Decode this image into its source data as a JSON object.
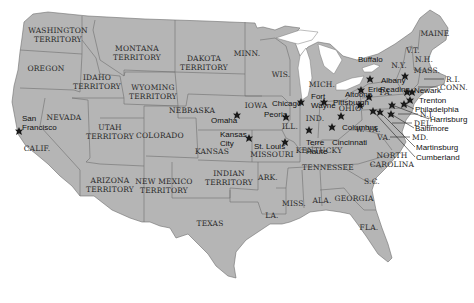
{
  "map": {
    "colors": {
      "land": "#b5b5b5",
      "border": "#6e6e6e",
      "water": "#ffffff",
      "marker": "#1a1a1a",
      "text": "#2a2a2a"
    },
    "regions": [
      {
        "id": "washington",
        "lines": [
          "WASHINGTON",
          "TERRITORY"
        ],
        "x": 58,
        "y": 33
      },
      {
        "id": "oregon",
        "lines": [
          "OREGON"
        ],
        "x": 46,
        "y": 71
      },
      {
        "id": "idaho",
        "lines": [
          "IDAHO",
          "TERRITORY"
        ],
        "x": 97,
        "y": 80
      },
      {
        "id": "montana",
        "lines": [
          "MONTANA",
          "TERRITORY"
        ],
        "x": 137,
        "y": 51
      },
      {
        "id": "wyoming",
        "lines": [
          "WYOMING",
          "TERRITORY"
        ],
        "x": 153,
        "y": 90
      },
      {
        "id": "dakota",
        "lines": [
          "DAKOTA",
          "TERRITORY"
        ],
        "x": 204,
        "y": 61
      },
      {
        "id": "minn",
        "lines": [
          "MINN."
        ],
        "x": 247,
        "y": 56
      },
      {
        "id": "wis",
        "lines": [
          "WIS."
        ],
        "x": 281,
        "y": 77
      },
      {
        "id": "mich",
        "lines": [
          "MICH."
        ],
        "x": 322,
        "y": 87
      },
      {
        "id": "nevada",
        "lines": [
          "NEVADA"
        ],
        "x": 64,
        "y": 120
      },
      {
        "id": "california",
        "lines": [
          "CALIF."
        ],
        "x": 37,
        "y": 151
      },
      {
        "id": "utah",
        "lines": [
          "UTAH",
          "TERRITORY"
        ],
        "x": 110,
        "y": 130
      },
      {
        "id": "colorado",
        "lines": [
          "COLORADO"
        ],
        "x": 160,
        "y": 138
      },
      {
        "id": "nebraska",
        "lines": [
          "NEBRASKA"
        ],
        "x": 192,
        "y": 113
      },
      {
        "id": "iowa",
        "lines": [
          "IOWA"
        ],
        "x": 256,
        "y": 108
      },
      {
        "id": "kansas",
        "lines": [
          "KANSAS"
        ],
        "x": 212,
        "y": 154
      },
      {
        "id": "missouri",
        "lines": [
          "MISSOURI"
        ],
        "x": 272,
        "y": 157
      },
      {
        "id": "ill",
        "lines": [
          "ILL."
        ],
        "x": 290,
        "y": 129
      },
      {
        "id": "ind",
        "lines": [
          "IND."
        ],
        "x": 315,
        "y": 121
      },
      {
        "id": "ohio",
        "lines": [
          "OHIO"
        ],
        "x": 350,
        "y": 111
      },
      {
        "id": "kentucky",
        "lines": [
          "KENTUCKY"
        ],
        "x": 319,
        "y": 153
      },
      {
        "id": "wva",
        "lines": [
          "W. VA."
        ],
        "x": 368,
        "y": 132
      },
      {
        "id": "va",
        "lines": [
          "VA."
        ],
        "x": 384,
        "y": 140
      },
      {
        "id": "arizona",
        "lines": [
          "ARIZONA",
          "TERRITORY"
        ],
        "x": 110,
        "y": 183
      },
      {
        "id": "new-mexico",
        "lines": [
          "NEW MEXICO",
          "TERRITORY"
        ],
        "x": 164,
        "y": 184
      },
      {
        "id": "indian",
        "lines": [
          "INDIAN",
          "TERRITORY"
        ],
        "x": 229,
        "y": 176
      },
      {
        "id": "ark",
        "lines": [
          "ARK."
        ],
        "x": 268,
        "y": 180
      },
      {
        "id": "tennessee",
        "lines": [
          "TENNESSEE"
        ],
        "x": 328,
        "y": 170
      },
      {
        "id": "north-carolina",
        "lines": [
          "NORTH",
          "CAROLINA"
        ],
        "x": 392,
        "y": 158
      },
      {
        "id": "sc",
        "lines": [
          "S.C."
        ],
        "x": 372,
        "y": 184
      },
      {
        "id": "miss",
        "lines": [
          "MISS."
        ],
        "x": 294,
        "y": 206
      },
      {
        "id": "ala",
        "lines": [
          "ALA."
        ],
        "x": 322,
        "y": 203
      },
      {
        "id": "georgia",
        "lines": [
          "GEORGIA"
        ],
        "x": 354,
        "y": 201
      },
      {
        "id": "la",
        "lines": [
          "LA."
        ],
        "x": 272,
        "y": 218
      },
      {
        "id": "texas",
        "lines": [
          "TEXAS"
        ],
        "x": 210,
        "y": 226
      },
      {
        "id": "fla",
        "lines": [
          "FLA."
        ],
        "x": 369,
        "y": 230
      },
      {
        "id": "maine",
        "lines": [
          "MAINE"
        ],
        "x": 435,
        "y": 36
      },
      {
        "id": "vt",
        "lines": [
          "V.T."
        ],
        "x": 413,
        "y": 53
      },
      {
        "id": "nh",
        "lines": [
          "N.H."
        ],
        "x": 424,
        "y": 62
      },
      {
        "id": "ny",
        "lines": [
          "N.Y."
        ],
        "x": 399,
        "y": 68
      },
      {
        "id": "mass",
        "lines": [
          "MASS."
        ],
        "x": 427,
        "y": 73
      },
      {
        "id": "pa",
        "lines": [
          "PA."
        ],
        "x": 386,
        "y": 95
      }
    ],
    "cities": [
      {
        "name": "San Francisco",
        "lines": [
          "San",
          "Francisco"
        ],
        "mx": 19,
        "my": 131,
        "lx": 22,
        "ly": 121
      },
      {
        "name": "Omaha",
        "lines": [
          "Omaha"
        ],
        "mx": 237,
        "my": 115,
        "lx": 211,
        "ly": 123
      },
      {
        "name": "Kansas City",
        "lines": [
          "Kansas",
          "City"
        ],
        "mx": 249,
        "my": 138,
        "lx": 220,
        "ly": 137
      },
      {
        "name": "St. Louis",
        "lines": [
          "St. Louis"
        ],
        "mx": 285,
        "my": 142,
        "lx": 254,
        "ly": 149
      },
      {
        "name": "Chicago",
        "lines": [
          "Chicago"
        ],
        "mx": 301,
        "my": 102,
        "lx": 272,
        "ly": 106
      },
      {
        "name": "Peoria",
        "lines": [
          "Peoria"
        ],
        "mx": 286,
        "my": 117,
        "lx": 264,
        "ly": 117
      },
      {
        "name": "Fort Wayne",
        "lines": [
          "Fort",
          "Wayne"
        ],
        "mx": 324,
        "my": 102,
        "lx": 311,
        "ly": 99
      },
      {
        "name": "Terre Haute",
        "lines": [
          "Terre",
          "Haute"
        ],
        "mx": 309,
        "my": 130,
        "lx": 306,
        "ly": 145
      },
      {
        "name": "Cincinnati",
        "lines": [
          "Cincinnati"
        ],
        "mx": 332,
        "my": 127,
        "lx": 332,
        "ly": 145
      },
      {
        "name": "Columbus",
        "lines": [
          "Columbus"
        ],
        "mx": 341,
        "my": 116,
        "lx": 342,
        "ly": 130
      },
      {
        "name": "Altoona",
        "lines": [
          "Altoona"
        ],
        "mx": 369,
        "my": 97,
        "lx": 345,
        "ly": 97
      },
      {
        "name": "Pittsburgh",
        "lines": [
          "Pittsburgh"
        ],
        "mx": 360,
        "my": 105,
        "lx": 333,
        "ly": 105
      },
      {
        "name": "Erie",
        "lines": [
          "Erie"
        ],
        "mx": 361,
        "my": 90,
        "lx": 368,
        "ly": 92
      },
      {
        "name": "Buffalo",
        "lines": [
          "Buffalo"
        ],
        "mx": 370,
        "my": 79,
        "lx": 358,
        "ly": 62
      },
      {
        "name": "Albany",
        "lines": [
          "Albany"
        ],
        "mx": 405,
        "my": 76,
        "lx": 381,
        "ly": 83
      },
      {
        "name": "Reading",
        "lines": [
          "Reading"
        ],
        "mx": 407,
        "my": 92,
        "lx": 380,
        "ly": 92
      },
      {
        "name": "Newark",
        "lines": [
          "Newark"
        ],
        "mx": 412,
        "my": 92,
        "lx": 414,
        "ly": 93
      },
      {
        "name": "Trenton",
        "lines": [
          "Trenton"
        ],
        "mx": 410,
        "my": 100,
        "lx": 419,
        "ly": 103
      },
      {
        "name": "Philadelphia",
        "lines": [
          "Philadelphia"
        ],
        "mx": 404,
        "my": 104,
        "lx": 415,
        "ly": 112
      },
      {
        "name": "Harrisburg",
        "lines": [
          "Harrisburg"
        ],
        "mx": 392,
        "my": 105,
        "lx": 430,
        "ly": 122
      },
      {
        "name": "Baltimore",
        "lines": [
          "Baltimore"
        ],
        "mx": 391,
        "my": 114,
        "lx": 415,
        "ly": 131
      },
      {
        "name": "Martinsburg",
        "lines": [
          "Martinsburg"
        ],
        "mx": 380,
        "my": 112,
        "lx": 416,
        "ly": 150
      },
      {
        "name": "Cumberland",
        "lines": [
          "Cumberland"
        ],
        "mx": 373,
        "my": 111,
        "lx": 416,
        "ly": 160
      }
    ],
    "callouts": [
      {
        "label": "R.I.",
        "x": 446,
        "y": 82
      },
      {
        "label": "CONN.",
        "x": 440,
        "y": 90
      },
      {
        "label": "N.J.",
        "x": 420,
        "y": 117
      },
      {
        "label": "DEL.",
        "x": 414,
        "y": 126
      },
      {
        "label": "MD.",
        "x": 412,
        "y": 140
      }
    ]
  }
}
